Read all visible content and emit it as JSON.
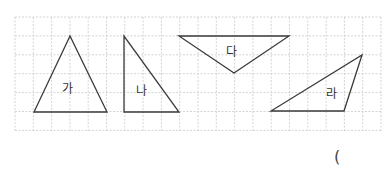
{
  "figure": {
    "grid": {
      "x0": 15,
      "y0": 17,
      "cols": 20,
      "rows": 6,
      "cell_w": 18.3,
      "cell_h": 18.9,
      "line_color": "#c9c9c9"
    },
    "stroke_color": "#3a3a3a",
    "triangles": [
      {
        "id": "ga",
        "label": "가",
        "points": [
          [
            70,
            36
          ],
          [
            34,
            112
          ],
          [
            107,
            112
          ]
        ],
        "label_pos": [
          62,
          93
        ]
      },
      {
        "id": "na",
        "label": "나",
        "points": [
          [
            124,
            36
          ],
          [
            124,
            112
          ],
          [
            179,
            112
          ]
        ],
        "label_pos": [
          136,
          95
        ]
      },
      {
        "id": "da",
        "label": "다",
        "points": [
          [
            179,
            36
          ],
          [
            289,
            36
          ],
          [
            234,
            73
          ]
        ],
        "label_pos": [
          226,
          56
        ]
      },
      {
        "id": "ra",
        "label": "라",
        "points": [
          [
            271,
            111
          ],
          [
            344,
            111
          ],
          [
            362,
            55
          ]
        ],
        "label_pos": [
          326,
          98
        ]
      }
    ]
  },
  "answer": {
    "open_paren": "("
  }
}
